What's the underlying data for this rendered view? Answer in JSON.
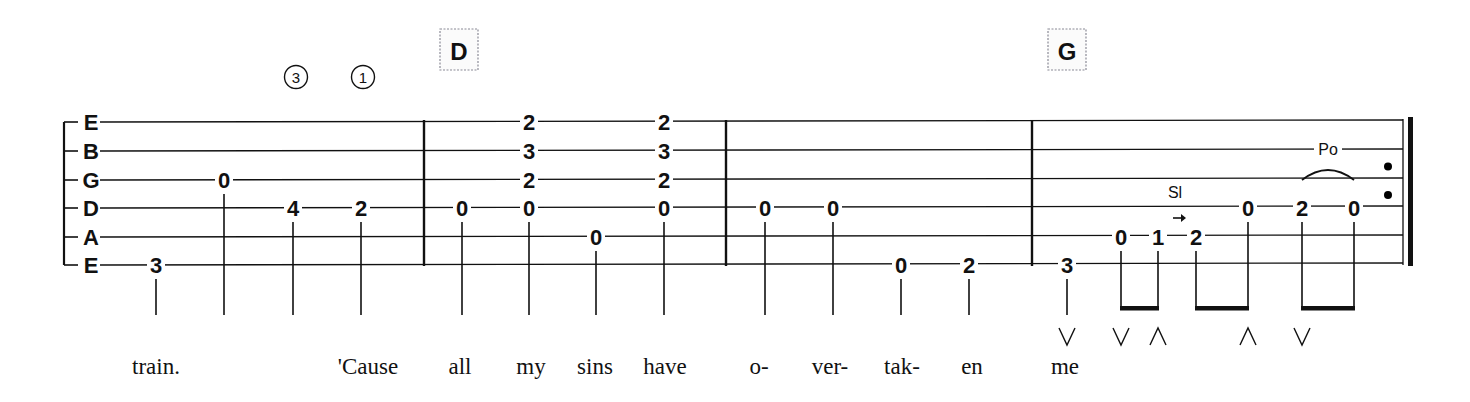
{
  "colors": {
    "ink": "#111111",
    "chord_box_border": "#8a8a96",
    "background": "#ffffff"
  },
  "tuning": [
    "E",
    "B",
    "G",
    "D",
    "A",
    "E"
  ],
  "string_y": [
    122,
    151,
    180,
    208,
    237,
    265
  ],
  "chords": [
    {
      "name": "D",
      "x": 459
    },
    {
      "name": "G",
      "x": 1067
    }
  ],
  "finger_circles": [
    {
      "label": "③",
      "x": 296
    },
    {
      "label": "①",
      "x": 363
    }
  ],
  "barlines": [
    424,
    726,
    1032
  ],
  "final_barline": {
    "thin_x": 1403,
    "thick_x": 1409,
    "repeat_dots_x": 1388
  },
  "notes": [
    {
      "x": 156,
      "frets": [
        {
          "string": 5,
          "fret": "3"
        }
      ]
    },
    {
      "x": 224,
      "frets": [
        {
          "string": 2,
          "fret": "0"
        }
      ]
    },
    {
      "x": 293,
      "frets": [
        {
          "string": 3,
          "fret": "4"
        }
      ]
    },
    {
      "x": 361,
      "frets": [
        {
          "string": 3,
          "fret": "2"
        }
      ]
    },
    {
      "x": 462,
      "frets": [
        {
          "string": 3,
          "fret": "0"
        }
      ]
    },
    {
      "x": 529,
      "frets": [
        {
          "string": 0,
          "fret": "2"
        },
        {
          "string": 1,
          "fret": "3"
        },
        {
          "string": 2,
          "fret": "2"
        },
        {
          "string": 3,
          "fret": "0"
        }
      ]
    },
    {
      "x": 596,
      "frets": [
        {
          "string": 4,
          "fret": "0"
        }
      ]
    },
    {
      "x": 664,
      "frets": [
        {
          "string": 0,
          "fret": "2"
        },
        {
          "string": 1,
          "fret": "3"
        },
        {
          "string": 2,
          "fret": "2"
        },
        {
          "string": 3,
          "fret": "0"
        }
      ]
    },
    {
      "x": 765,
      "frets": [
        {
          "string": 3,
          "fret": "0"
        }
      ]
    },
    {
      "x": 833,
      "frets": [
        {
          "string": 3,
          "fret": "0"
        }
      ]
    },
    {
      "x": 901,
      "frets": [
        {
          "string": 5,
          "fret": "0"
        }
      ]
    },
    {
      "x": 969,
      "frets": [
        {
          "string": 5,
          "fret": "2"
        }
      ]
    },
    {
      "x": 1067,
      "frets": [
        {
          "string": 5,
          "fret": "3"
        }
      ]
    },
    {
      "x": 1121,
      "frets": [
        {
          "string": 4,
          "fret": "0"
        }
      ]
    },
    {
      "x": 1158,
      "frets": [
        {
          "string": 4,
          "fret": "1"
        }
      ]
    },
    {
      "x": 1196,
      "frets": [
        {
          "string": 4,
          "fret": "2"
        }
      ]
    },
    {
      "x": 1248,
      "frets": [
        {
          "string": 3,
          "fret": "0"
        }
      ]
    },
    {
      "x": 1302,
      "frets": [
        {
          "string": 3,
          "fret": "2"
        }
      ]
    },
    {
      "x": 1354,
      "frets": [
        {
          "string": 3,
          "fret": "0"
        }
      ]
    }
  ],
  "beams": [
    {
      "x1": 1121,
      "x2": 1158
    },
    {
      "x1": 1196,
      "x2": 1248
    },
    {
      "x1": 1302,
      "x2": 1354
    }
  ],
  "techniques": [
    {
      "label": "Sl",
      "x": 1175,
      "y": 198,
      "type": "slide"
    },
    {
      "label": "Po",
      "x": 1328,
      "y": 155,
      "type": "pull-off"
    }
  ],
  "strums": [
    {
      "symbol": "∨",
      "x": 1067
    },
    {
      "symbol": "∨",
      "x": 1121
    },
    {
      "symbol": "∧",
      "x": 1158
    },
    {
      "symbol": "∧",
      "x": 1248
    },
    {
      "symbol": "∨",
      "x": 1302
    }
  ],
  "lyrics": [
    {
      "text": "train.",
      "x": 156
    },
    {
      "text": "'Cause",
      "x": 368
    },
    {
      "text": "all",
      "x": 460
    },
    {
      "text": "my",
      "x": 531
    },
    {
      "text": "sins",
      "x": 595
    },
    {
      "text": "have",
      "x": 665
    },
    {
      "text": "o-",
      "x": 759
    },
    {
      "text": "ver-",
      "x": 830
    },
    {
      "text": "tak-",
      "x": 902
    },
    {
      "text": "en",
      "x": 972
    },
    {
      "text": "me",
      "x": 1065
    }
  ]
}
